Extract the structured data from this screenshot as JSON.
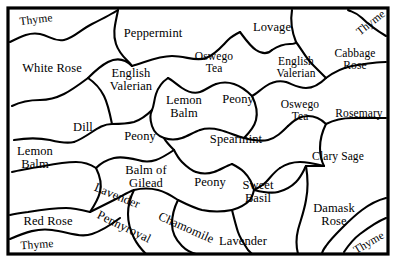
{
  "map": {
    "title": "Herb Garden Plot Map",
    "background_color": "#ffffff",
    "ink_color": "#000000",
    "frame": {
      "x": 8,
      "y": 8,
      "width": 380,
      "height": 246,
      "stroke_width": 3.2
    },
    "regions": [
      {
        "name": "thyme-top-left",
        "label": "Thyme",
        "x": 36,
        "y": 20,
        "size": 11.5,
        "rotate": -7,
        "lines": [
          "Thyme"
        ]
      },
      {
        "name": "peppermint",
        "label": "Peppermint",
        "x": 153,
        "y": 33,
        "size": 12.5,
        "rotate": 0,
        "lines": [
          "Peppermint"
        ]
      },
      {
        "name": "lovage",
        "label": "Lovage",
        "x": 272,
        "y": 27,
        "size": 12.5,
        "rotate": 0,
        "lines": [
          "Lovage"
        ]
      },
      {
        "name": "thyme-top-right",
        "label": "Thyme",
        "x": 371,
        "y": 23,
        "size": 11.5,
        "rotate": -38,
        "lines": [
          "Thyme"
        ]
      },
      {
        "name": "white-rose",
        "label": "White Rose",
        "x": 52,
        "y": 68,
        "size": 12.5,
        "rotate": 0,
        "lines": [
          "White Rose"
        ]
      },
      {
        "name": "english-valerian-w",
        "label": "English Valerian",
        "x": 131,
        "y": 80,
        "size": 12.5,
        "rotate": 0,
        "lines": [
          "English",
          "Valerian"
        ]
      },
      {
        "name": "oswego-tea-n",
        "label": "Oswego Tea",
        "x": 214,
        "y": 63,
        "size": 11.5,
        "rotate": 0,
        "lines": [
          "Oswego",
          "Tea"
        ]
      },
      {
        "name": "english-valerian-e",
        "label": "English Valerian",
        "x": 296,
        "y": 68,
        "size": 11.5,
        "rotate": 0,
        "lines": [
          "English",
          "Valerian"
        ]
      },
      {
        "name": "cabbage-rose",
        "label": "Cabbage Rose",
        "x": 355,
        "y": 60,
        "size": 11.5,
        "rotate": 0,
        "lines": [
          "Cabbage",
          "Rose"
        ]
      },
      {
        "name": "lemon-balm-center",
        "label": "Lemon Balm",
        "x": 184,
        "y": 107,
        "size": 12.5,
        "rotate": 0,
        "lines": [
          "Lemon",
          "Balm"
        ]
      },
      {
        "name": "peony-ne",
        "label": "Peony",
        "x": 238,
        "y": 99,
        "size": 12.5,
        "rotate": 0,
        "lines": [
          "Peony"
        ]
      },
      {
        "name": "oswego-tea-e",
        "label": "Oswego Tea",
        "x": 300,
        "y": 111,
        "size": 11.5,
        "rotate": 0,
        "lines": [
          "Oswego",
          "Tea"
        ]
      },
      {
        "name": "rosemary",
        "label": "Rosemary",
        "x": 359,
        "y": 114,
        "size": 11.5,
        "rotate": 0,
        "lines": [
          "Rosemary"
        ]
      },
      {
        "name": "dill",
        "label": "Dill",
        "x": 83,
        "y": 127,
        "size": 12.5,
        "rotate": 0,
        "lines": [
          "Dill"
        ]
      },
      {
        "name": "peony-w",
        "label": "Peony",
        "x": 140,
        "y": 136,
        "size": 12.5,
        "rotate": 0,
        "lines": [
          "Peony"
        ]
      },
      {
        "name": "spearmint",
        "label": "Spearmint",
        "x": 236,
        "y": 139,
        "size": 12.5,
        "rotate": 0,
        "lines": [
          "Spearmint"
        ]
      },
      {
        "name": "lemon-balm-w",
        "label": "Lemon Balm",
        "x": 35,
        "y": 158,
        "size": 12.5,
        "rotate": 0,
        "lines": [
          "Lemon",
          "Balm"
        ]
      },
      {
        "name": "balm-of-gilead",
        "label": "Balm of Gilead",
        "x": 146,
        "y": 177,
        "size": 12.5,
        "rotate": 0,
        "lines": [
          "Balm of",
          "Gilead"
        ]
      },
      {
        "name": "clary-sage",
        "label": "Clary Sage",
        "x": 338,
        "y": 157,
        "size": 11.5,
        "rotate": 0,
        "lines": [
          "Clary Sage"
        ]
      },
      {
        "name": "peony-s",
        "label": "Peony",
        "x": 210,
        "y": 182,
        "size": 12.5,
        "rotate": 0,
        "lines": [
          "Peony"
        ]
      },
      {
        "name": "sweet-basil",
        "label": "Sweet Basil",
        "x": 258,
        "y": 192,
        "size": 12.5,
        "rotate": 0,
        "lines": [
          "Sweet",
          "Basil"
        ]
      },
      {
        "name": "lavender-diagonal",
        "label": "Lavender",
        "x": 117,
        "y": 196,
        "size": 12.5,
        "rotate": 22,
        "lines": [
          "Lavender"
        ]
      },
      {
        "name": "red-rose",
        "label": "Red Rose",
        "x": 48,
        "y": 221,
        "size": 12.5,
        "rotate": 0,
        "lines": [
          "Red Rose"
        ]
      },
      {
        "name": "damask-rose",
        "label": "Damask Rose",
        "x": 334,
        "y": 215,
        "size": 12.5,
        "rotate": 0,
        "lines": [
          "Damask",
          "Rose"
        ]
      },
      {
        "name": "pennyroyal",
        "label": "Pennyroyal",
        "x": 124,
        "y": 227,
        "size": 12.5,
        "rotate": 26,
        "lines": [
          "Pennyroyal"
        ]
      },
      {
        "name": "chamomile",
        "label": "Chamomile",
        "x": 186,
        "y": 228,
        "size": 12.5,
        "rotate": 24,
        "lines": [
          "Chamomile"
        ]
      },
      {
        "name": "lavender-bottom",
        "label": "Lavender",
        "x": 243,
        "y": 241,
        "size": 12.5,
        "rotate": 0,
        "lines": [
          "Lavender"
        ]
      },
      {
        "name": "thyme-bottom-left",
        "label": "Thyme",
        "x": 37,
        "y": 245,
        "size": 11.5,
        "rotate": -4,
        "lines": [
          "Thyme"
        ]
      },
      {
        "name": "thyme-bottom-right",
        "label": "Thyme",
        "x": 369,
        "y": 243,
        "size": 11.5,
        "rotate": -30,
        "lines": [
          "Thyme"
        ]
      }
    ],
    "boundaries": [
      "M10,42 C22,36 30,32 40,34 C50,36 54,42 64,40 C74,38 80,30 92,24 C104,18 112,14 118,10",
      "M10,239 C26,232 38,228 52,230 C68,232 80,238 92,234 C104,230 112,224 120,218",
      "M386,36 C376,30 368,24 362,18 C356,12 352,12 348,10",
      "M386,218 C376,222 368,228 360,234 C352,240 348,246 344,252",
      "M118,10 C116,22 112,32 116,44 C120,56 128,60 132,66",
      "M292,10 C290,22 292,32 296,42",
      "M132,66 C146,62 158,56 172,56 C186,56 196,62 206,58 C216,54 222,46 228,40 C232,36 236,34 240,32",
      "M240,32 C246,40 250,46 256,50 C262,54 268,54 272,50",
      "M272,50 C278,46 284,44 290,44 C294,44 296,43 296,42",
      "M296,42 C302,50 306,58 312,64 C318,70 322,74 326,78",
      "M326,78 C334,72 342,68 352,66 C364,64 376,62 386,62",
      "M326,78 C320,84 314,88 306,88 C298,88 292,84 286,82",
      "M286,82 C278,80 272,82 266,86 C260,90 256,94 252,96",
      "M252,96 C246,90 240,86 234,84 C228,82 222,82 216,84",
      "M216,84 C210,86 206,90 200,92 C194,94 188,92 182,88 C176,84 172,80 168,78",
      "M168,78 C162,82 158,88 156,94 C154,100 154,106 152,110",
      "M152,110 C146,116 140,120 134,122 C126,124 118,124 112,124",
      "M112,124 C104,124 98,128 92,132 C86,136 80,140 74,142",
      "M74,142 C66,144 58,142 50,140 C40,138 26,138 14,140",
      "M112,124 C110,114 108,104 104,96 C100,88 94,82 88,78",
      "M88,78 C80,84 72,90 64,94 C56,98 48,100 40,100 C30,100 20,102 12,106",
      "M88,78 C94,72 100,66 108,62 C116,58 124,58 132,66",
      "M252,96 C256,104 258,112 256,120 C254,128 248,134 244,138",
      "M244,138 C236,136 228,132 220,130 C212,128 206,128 200,130",
      "M200,130 C194,132 188,136 182,138 C176,140 170,140 164,138",
      "M164,138 C158,136 154,132 152,126 C150,120 150,114 152,110",
      "M244,138 C252,140 260,142 268,140 C276,138 282,132 288,126",
      "M288,126 C294,120 300,116 308,116 C316,116 322,120 326,124",
      "M326,124 C334,120 342,118 352,118 C364,118 376,118 386,118",
      "M326,124 C322,132 320,140 320,148 C320,156 322,162 324,166",
      "M324,166 C316,164 308,162 300,162 C292,162 286,164 280,168",
      "M280,168 C274,172 270,178 266,182 C262,186 258,188 254,190",
      "M254,190 C252,182 248,176 244,172 C240,168 236,166 232,164",
      "M232,164 C226,166 220,170 214,172 C208,174 202,174 196,172",
      "M196,172 C190,170 186,166 182,162 C178,158 176,154 174,150",
      "M174,150 C170,146 166,142 164,138",
      "M174,150 C168,154 162,158 156,160 C150,162 144,162 138,160",
      "M138,160 C130,158 122,156 114,158 C106,160 100,164 96,168",
      "M96,168 C90,164 84,162 76,162 C66,162 54,164 44,166 C32,168 20,170 12,172",
      "M96,168 C100,176 102,184 100,192 C98,200 94,206 90,212",
      "M90,212 C82,210 74,208 66,208 C54,208 40,210 28,212 C20,213 14,214 10,215",
      "M90,212 C98,208 106,204 114,200 C122,196 128,192 134,190",
      "M134,190 C142,188 150,188 158,190 C166,192 172,196 178,200",
      "M178,200 C186,204 194,208 202,210 C212,212 222,212 232,210",
      "M232,210 C240,208 246,204 250,200 C252,198 253,194 254,190",
      "M134,190 C130,198 128,206 128,214 C128,222 130,230 134,238 C138,246 142,250 146,254",
      "M178,200 C174,208 172,216 172,224 C172,232 176,240 182,246 C188,252 192,253 196,254",
      "M232,210 C234,218 236,226 238,232 C240,238 244,244 248,250 C250,252 251,253 252,254",
      "M254,190 C262,192 270,194 278,192 C286,190 292,186 296,182 C300,178 302,174 304,170 C305,168 305,167 306,166",
      "M306,166 C314,166 320,166 324,166",
      "M306,166 C308,178 308,190 306,200 C304,212 300,222 298,230 C296,238 296,246 298,254",
      "M386,198 C378,200 370,204 362,210 C354,216 348,222 342,228 C336,234 330,240 326,246 C323,250 322,252 322,254"
    ]
  }
}
